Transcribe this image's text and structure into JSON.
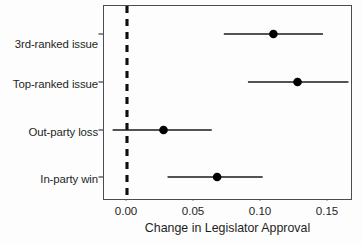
{
  "chart_data": {
    "type": "scatter",
    "title": "",
    "subtitle": "",
    "xlabel": "Change in Legislator Approval",
    "ylabel": "",
    "xlim": [
      -0.0172,
      0.1685
    ],
    "xticks": [
      0.0,
      0.05,
      0.1,
      0.15
    ],
    "xtick_labels": [
      "0.00",
      "0.05",
      "0.10",
      "0.15"
    ],
    "grid": false,
    "legend": null,
    "reference_line": {
      "orientation": "vertical",
      "value": 0.0,
      "style": "dashed",
      "color": "#000000"
    },
    "categories": [
      "3rd-ranked issue",
      "Top-ranked issue",
      "Out-party loss",
      "In-party win"
    ],
    "series": [
      {
        "name": "Change in Legislator Approval",
        "marker": "filled-circle",
        "color": "#000000",
        "points": [
          {
            "category": "3rd-ranked issue",
            "estimate": 0.11,
            "ci_low": 0.073,
            "ci_high": 0.147
          },
          {
            "category": "Top-ranked issue",
            "estimate": 0.128,
            "ci_low": 0.091,
            "ci_high": 0.166
          },
          {
            "category": "Out-party loss",
            "estimate": 0.028,
            "ci_low": -0.01,
            "ci_high": 0.064
          },
          {
            "category": "In-party win",
            "estimate": 0.068,
            "ci_low": 0.031,
            "ci_high": 0.102
          }
        ]
      }
    ],
    "values": [
      0.11,
      0.128,
      0.028,
      0.068
    ],
    "ci_low": [
      0.073,
      0.091,
      -0.01,
      0.031
    ],
    "ci_high": [
      0.147,
      0.166,
      0.064,
      0.102
    ]
  },
  "axes": {
    "x_title": "Change in Legislator Approval",
    "x_tick_0": "0.00",
    "x_tick_1": "0.05",
    "x_tick_2": "0.10",
    "x_tick_3": "0.15",
    "y_tick_0": "3rd-ranked issue",
    "y_tick_1": "Top-ranked issue",
    "y_tick_2": "Out-party loss",
    "y_tick_3": "In-party win"
  },
  "colors": {
    "marker": "#000000",
    "line": "#1a1a1a",
    "frame": "#4d4d4d",
    "reference": "#000000",
    "background": "#fdfdfd",
    "text": "#1f1f1f"
  }
}
